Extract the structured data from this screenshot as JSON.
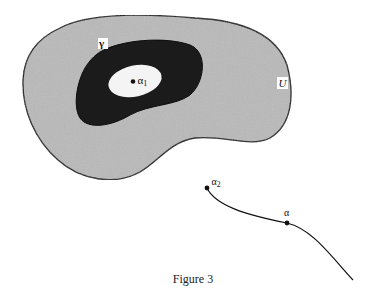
{
  "figure": {
    "caption": "Figure 3",
    "regions": {
      "outer": {
        "label": "U",
        "fill": "#b8b8b8"
      },
      "annulus": {
        "label": "γ",
        "fill": "#1a1a1a"
      },
      "inner_hole": {
        "fill": "#f4f4f4"
      }
    },
    "points": {
      "alpha1": {
        "symbol": "α",
        "subscript": "1"
      },
      "alpha2": {
        "symbol": "α",
        "subscript": "2"
      },
      "alpha": {
        "symbol": "α"
      }
    },
    "colors": {
      "stroke": "#111111",
      "background": "#ffffff"
    }
  }
}
